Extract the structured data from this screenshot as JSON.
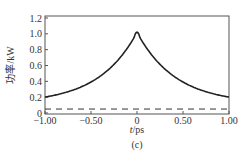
{
  "chart_data": {
    "type": "line",
    "title": "",
    "caption": "(c)",
    "xlabel": "t/ps",
    "ylabel": "功率/kW",
    "xlim": [
      -1.0,
      1.0
    ],
    "ylim": [
      0,
      1.2
    ],
    "xticks": [
      "-1.00",
      "-0.50",
      "0",
      "0.50",
      "1.00"
    ],
    "yticks": [
      "0",
      "0.2",
      "0.4",
      "0.6",
      "0.8",
      "1.0",
      "1.2"
    ],
    "grid": false,
    "legend": null,
    "series": [
      {
        "name": "pulse power",
        "style": "solid",
        "x": [
          -1.0,
          -0.9,
          -0.8,
          -0.7,
          -0.6,
          -0.5,
          -0.4,
          -0.3,
          -0.2,
          -0.1,
          -0.05,
          0.0,
          0.05,
          0.1,
          0.2,
          0.3,
          0.4,
          0.5,
          0.6,
          0.7,
          0.8,
          0.9,
          1.0
        ],
        "y": [
          0.12,
          0.15,
          0.18,
          0.22,
          0.27,
          0.33,
          0.4,
          0.49,
          0.6,
          0.76,
          0.88,
          1.02,
          0.88,
          0.76,
          0.6,
          0.49,
          0.4,
          0.33,
          0.27,
          0.22,
          0.18,
          0.15,
          0.12
        ]
      },
      {
        "name": "background level",
        "style": "dashed",
        "x": [
          -1.0,
          1.0
        ],
        "y": [
          0.05,
          0.05
        ]
      }
    ]
  }
}
